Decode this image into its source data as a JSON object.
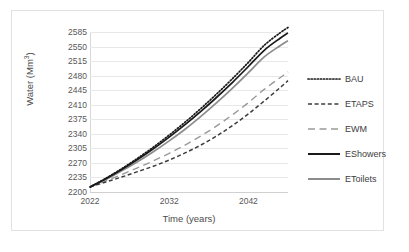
{
  "chart_data": {
    "type": "line",
    "title": "",
    "xlabel": "Time (years)",
    "ylabel": "Water (Mm3)",
    "ylabel_html": "Water (Mm³)",
    "ylabel_base": "Water (Mm",
    "ylabel_sup": "3",
    "ylabel_tail": ")",
    "xlim": [
      2022,
      2047
    ],
    "ylim": [
      2200,
      2585
    ],
    "grid": true,
    "legend_position": "right",
    "yticks": [
      2200,
      2235,
      2270,
      2305,
      2340,
      2375,
      2410,
      2445,
      2480,
      2515,
      2550,
      2585
    ],
    "xticks": [
      2022,
      2032,
      2042
    ],
    "x": [
      2022,
      2024,
      2026,
      2028,
      2030,
      2032,
      2034,
      2036,
      2038,
      2040,
      2042,
      2044,
      2046,
      2047
    ],
    "series": [
      {
        "name": "BAU",
        "style": "dotted",
        "color": "#1a1a1a",
        "values": [
          2212,
          2233,
          2256,
          2281,
          2308,
          2337,
          2368,
          2401,
          2436,
          2473,
          2512,
          2553,
          2583,
          2596
        ]
      },
      {
        "name": "ETAPS",
        "style": "dashed",
        "color": "#3d3d3d",
        "values": [
          2212,
          2224,
          2236,
          2249,
          2262,
          2277,
          2294,
          2313,
          2335,
          2360,
          2388,
          2419,
          2451,
          2468
        ]
      },
      {
        "name": "EWM",
        "style": "long-dash",
        "color": "#9a9a9a",
        "values": [
          2212,
          2227,
          2242,
          2258,
          2275,
          2293,
          2313,
          2335,
          2359,
          2386,
          2415,
          2447,
          2475,
          2489
        ]
      },
      {
        "name": "EShowers",
        "style": "solid",
        "color": "#1a1a1a",
        "values": [
          2212,
          2232,
          2254,
          2278,
          2304,
          2332,
          2362,
          2394,
          2428,
          2464,
          2502,
          2541,
          2570,
          2583
        ]
      },
      {
        "name": "EToilets",
        "style": "solid",
        "color": "#8c8c8c",
        "values": [
          2212,
          2230,
          2251,
          2273,
          2297,
          2323,
          2351,
          2382,
          2415,
          2450,
          2487,
          2525,
          2552,
          2564
        ]
      }
    ]
  },
  "legend": {
    "items": [
      {
        "label": "BAU"
      },
      {
        "label": "ETAPS"
      },
      {
        "label": "EWM"
      },
      {
        "label": "EShowers"
      },
      {
        "label": "EToilets"
      }
    ]
  }
}
